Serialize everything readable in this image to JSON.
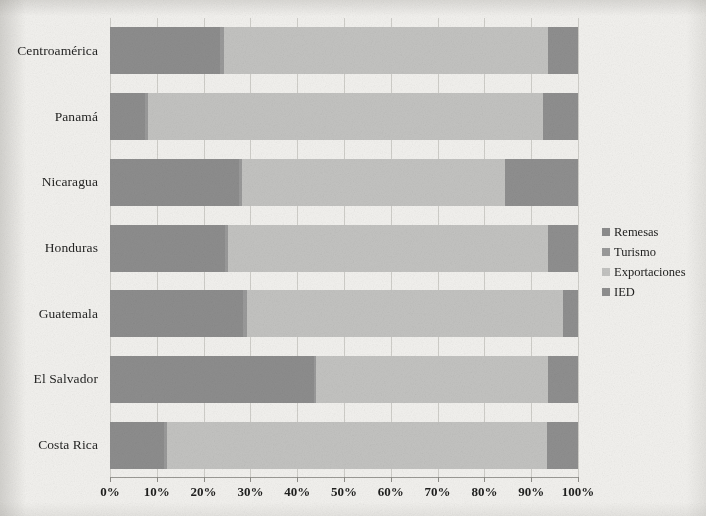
{
  "chart_data": {
    "type": "bar",
    "orientation": "horizontal",
    "stacked": true,
    "normalized": true,
    "title": "",
    "subtitle": "",
    "xlabel": "",
    "ylabel": "",
    "xlim": [
      0,
      100
    ],
    "xticks": [
      0,
      10,
      20,
      30,
      40,
      50,
      60,
      70,
      80,
      90,
      100
    ],
    "xtick_labels": [
      "0%",
      "10%",
      "20%",
      "30%",
      "40%",
      "50%",
      "60%",
      "70%",
      "80%",
      "90%",
      "100%"
    ],
    "grid": true,
    "grid_axis": "x",
    "legend_position": "right",
    "categories": [
      "Centroamérica",
      "Panamá",
      "Nicaragua",
      "Honduras",
      "Guatemala",
      "El Salvador",
      "Costa Rica"
    ],
    "series": [
      {
        "name": "Remesas",
        "color": "#8d8d8d",
        "values": [
          23.5,
          7.5,
          27.5,
          24.5,
          28.5,
          43.5,
          11.5
        ]
      },
      {
        "name": "Turismo",
        "color": "#9a9a9a",
        "values": [
          0.8,
          0.6,
          0.7,
          0.7,
          0.7,
          0.6,
          0.7
        ]
      },
      {
        "name": "Exportaciones",
        "color": "#c3c3c1",
        "values": [
          69.2,
          84.4,
          56.3,
          68.3,
          67.6,
          49.4,
          81.1
        ]
      },
      {
        "name": "IED",
        "color": "#8f8f8f",
        "values": [
          6.5,
          7.5,
          15.5,
          6.5,
          3.2,
          6.5,
          6.7
        ]
      }
    ]
  },
  "legend": {
    "items": [
      {
        "label": "Remesas",
        "color": "#8d8d8d"
      },
      {
        "label": "Turismo",
        "color": "#9a9a9a"
      },
      {
        "label": "Exportaciones",
        "color": "#c3c3c1"
      },
      {
        "label": "IED",
        "color": "#8f8f8f"
      }
    ]
  }
}
